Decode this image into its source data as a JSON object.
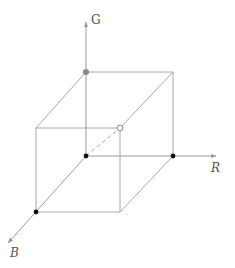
{
  "diagram": {
    "colors": {
      "line": "#a8a8a8",
      "axis": "#9a9a9a",
      "dot_black": "#111111",
      "dot_gray": "#8a8a8a",
      "label": "#555555"
    },
    "axes": [
      {
        "name": "G",
        "label": "G",
        "from": [
          86,
          156
        ],
        "to": [
          86,
          22
        ],
        "label_pos": [
          91,
          14
        ],
        "italic": false
      },
      {
        "name": "R",
        "label": "R",
        "from": [
          86,
          156
        ],
        "to": [
          216,
          156
        ],
        "label_pos": [
          211,
          162
        ],
        "italic": true
      },
      {
        "name": "B",
        "label": "B",
        "from": [
          86,
          156
        ],
        "to": [
          8,
          243
        ],
        "label_pos": [
          10,
          247
        ],
        "italic": true
      }
    ],
    "vertices": {
      "origin": [
        86,
        156
      ],
      "g": [
        86,
        72
      ],
      "r": [
        173,
        156
      ],
      "b": [
        36,
        212
      ],
      "gr": [
        173,
        72
      ],
      "gb": [
        36,
        128
      ],
      "rb": [
        120,
        212
      ],
      "white": [
        120,
        128
      ]
    },
    "points": [
      {
        "name": "black-origin",
        "at": [
          86,
          156
        ],
        "style": "filled-black"
      },
      {
        "name": "red-vertex",
        "at": [
          173,
          156
        ],
        "style": "filled-black"
      },
      {
        "name": "blue-vertex",
        "at": [
          36,
          212
        ],
        "style": "filled-black"
      },
      {
        "name": "green-vertex",
        "at": [
          86,
          72
        ],
        "style": "filled-gray"
      },
      {
        "name": "white-vertex",
        "at": [
          120,
          128
        ],
        "style": "open"
      }
    ],
    "dashed_edge": {
      "from": [
        86,
        156
      ],
      "to": [
        120,
        128
      ]
    }
  }
}
